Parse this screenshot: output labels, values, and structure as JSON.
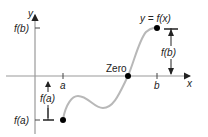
{
  "diagram": {
    "axes": {
      "x_label": "x",
      "y_label": "y"
    },
    "curve_label": "y = f(x)",
    "zero_label": "Zero",
    "tick_labels": {
      "a": "a",
      "b": "b",
      "fa": "f(a)",
      "fb": "f(b)"
    },
    "measures": {
      "fa_arrow_label": "f(a)",
      "fb_arrow_label": "f(b)"
    },
    "colors": {
      "axis": "#888888",
      "curve": "#b8b8b8",
      "point": "#000000",
      "text": "#222222"
    }
  }
}
